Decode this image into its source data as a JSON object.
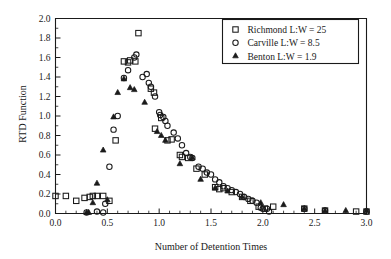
{
  "chart_data": {
    "type": "scatter",
    "title": "",
    "xlabel": "Number of Detention Times",
    "ylabel": "RTD Function",
    "xlim": [
      0.0,
      3.0
    ],
    "ylim": [
      0.0,
      2.0
    ],
    "xticks": [
      "0.0",
      "0.5",
      "1.0",
      "1.5",
      "2.0",
      "2.5",
      "3.0"
    ],
    "xtick_values": [
      0.0,
      0.5,
      1.0,
      1.5,
      2.0,
      2.5,
      3.0
    ],
    "xtick_minor_step": 0.1,
    "yticks": [
      "0.0",
      "0.2",
      "0.4",
      "0.6",
      "0.8",
      "1.0",
      "1.2",
      "1.4",
      "1.6",
      "1.8",
      "2.0"
    ],
    "ytick_values": [
      0.0,
      0.2,
      0.4,
      0.6,
      0.8,
      1.0,
      1.2,
      1.4,
      1.6,
      1.8,
      2.0
    ],
    "grid": false,
    "legend_position": "top-right",
    "series": [
      {
        "name": "Richmond",
        "label": "Richmond   L:W = 25",
        "marker": "square",
        "color": "#1a1a1a",
        "points": [
          [
            0.0,
            0.18
          ],
          [
            0.1,
            0.18
          ],
          [
            0.2,
            0.13
          ],
          [
            0.28,
            0.16
          ],
          [
            0.33,
            0.17
          ],
          [
            0.36,
            0.18
          ],
          [
            0.4,
            0.18
          ],
          [
            0.46,
            0.18
          ],
          [
            0.52,
            0.13
          ],
          [
            0.58,
            0.75
          ],
          [
            0.66,
            1.56
          ],
          [
            0.7,
            1.55
          ],
          [
            0.72,
            1.57
          ],
          [
            0.77,
            1.56
          ],
          [
            0.8,
            1.85
          ],
          [
            0.92,
            1.28
          ],
          [
            0.95,
            1.24
          ],
          [
            0.96,
            0.87
          ],
          [
            1.02,
            0.98
          ],
          [
            1.08,
            0.75
          ],
          [
            1.12,
            0.76
          ],
          [
            1.2,
            0.6
          ],
          [
            1.22,
            0.58
          ],
          [
            1.28,
            0.57
          ],
          [
            1.36,
            0.46
          ],
          [
            1.44,
            0.4
          ],
          [
            1.54,
            0.27
          ],
          [
            1.58,
            0.25
          ],
          [
            1.62,
            0.26
          ],
          [
            1.7,
            0.22
          ],
          [
            1.8,
            0.17
          ],
          [
            1.88,
            0.13
          ],
          [
            1.96,
            0.07
          ],
          [
            2.02,
            0.05
          ],
          [
            2.1,
            0.07
          ],
          [
            2.4,
            0.05
          ],
          [
            2.6,
            0.03
          ],
          [
            2.9,
            0.02
          ],
          [
            3.0,
            0.02
          ]
        ]
      },
      {
        "name": "Carville",
        "label": "Carville   L:W = 8.5",
        "marker": "circle",
        "color": "#1a1a1a",
        "points": [
          [
            0.3,
            0.01
          ],
          [
            0.4,
            0.02
          ],
          [
            0.46,
            0.01
          ],
          [
            0.48,
            0.1
          ],
          [
            0.52,
            0.48
          ],
          [
            0.56,
            0.86
          ],
          [
            0.6,
            1.0
          ],
          [
            0.66,
            1.39
          ],
          [
            0.7,
            1.47
          ],
          [
            0.76,
            1.6
          ],
          [
            0.78,
            1.63
          ],
          [
            0.84,
            1.4
          ],
          [
            0.88,
            1.43
          ],
          [
            0.9,
            1.34
          ],
          [
            0.92,
            1.3
          ],
          [
            0.96,
            1.2
          ],
          [
            1.0,
            1.04
          ],
          [
            1.01,
            1.01
          ],
          [
            1.04,
            0.99
          ],
          [
            1.06,
            0.95
          ],
          [
            1.08,
            0.9
          ],
          [
            1.14,
            0.83
          ],
          [
            1.18,
            0.77
          ],
          [
            1.22,
            0.7
          ],
          [
            1.26,
            0.62
          ],
          [
            1.3,
            0.58
          ],
          [
            1.32,
            0.57
          ],
          [
            1.38,
            0.48
          ],
          [
            1.42,
            0.46
          ],
          [
            1.46,
            0.42
          ],
          [
            1.5,
            0.4
          ],
          [
            1.54,
            0.35
          ],
          [
            1.58,
            0.32
          ],
          [
            1.62,
            0.28
          ],
          [
            1.66,
            0.26
          ],
          [
            1.7,
            0.24
          ],
          [
            1.74,
            0.22
          ],
          [
            1.78,
            0.2
          ],
          [
            1.82,
            0.17
          ],
          [
            1.86,
            0.15
          ],
          [
            1.9,
            0.13
          ],
          [
            1.94,
            0.11
          ],
          [
            1.98,
            0.06
          ],
          [
            2.0,
            0.05
          ],
          [
            2.04,
            0.05
          ],
          [
            2.06,
            0.02
          ],
          [
            2.4,
            0.05
          ],
          [
            2.6,
            0.03
          ],
          [
            3.0,
            0.02
          ]
        ]
      },
      {
        "name": "Benton",
        "label": "Benton   L:W = 1.9",
        "marker": "triangle",
        "color": "#1a1a1a",
        "points": [
          [
            0.3,
            0.01
          ],
          [
            0.32,
            0.01
          ],
          [
            0.36,
            0.11
          ],
          [
            0.4,
            0.31
          ],
          [
            0.46,
            0.65
          ],
          [
            0.5,
            0.14
          ],
          [
            0.56,
            0.99
          ],
          [
            0.6,
            1.24
          ],
          [
            0.66,
            1.38
          ],
          [
            0.72,
            1.29
          ],
          [
            0.76,
            1.27
          ],
          [
            0.86,
            1.14
          ],
          [
            0.98,
            0.84
          ],
          [
            1.02,
            0.8
          ],
          [
            1.06,
            0.75
          ],
          [
            1.2,
            0.51
          ],
          [
            1.32,
            0.57
          ],
          [
            1.4,
            0.35
          ],
          [
            1.54,
            0.26
          ],
          [
            1.66,
            0.23
          ],
          [
            1.8,
            0.17
          ],
          [
            1.98,
            0.11
          ],
          [
            2.2,
            0.09
          ],
          [
            2.4,
            0.05
          ],
          [
            2.6,
            0.03
          ],
          [
            2.8,
            0.03
          ],
          [
            3.0,
            0.03
          ]
        ]
      }
    ]
  },
  "legend": {
    "items": [
      {
        "marker": "square",
        "label": "Richmond   L:W = 25"
      },
      {
        "marker": "circle",
        "label": "Carville   L:W = 8.5"
      },
      {
        "marker": "triangle",
        "label": "Benton   L:W = 1.9"
      }
    ]
  },
  "axes": {
    "x_title": "Number of Detention Times",
    "y_title": "RTD Function"
  }
}
